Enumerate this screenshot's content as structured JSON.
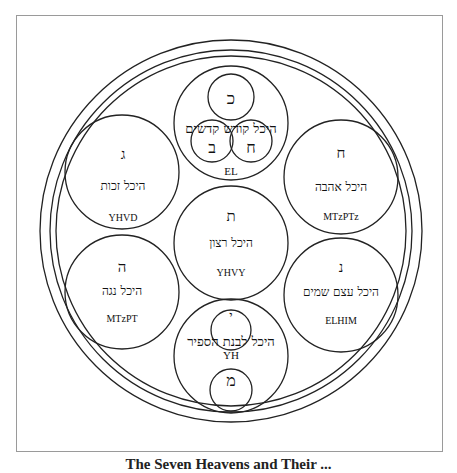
{
  "diagram": {
    "caption": "The Seven Heavens and Their ...",
    "circles": [
      {
        "id": "top",
        "letter": "כ",
        "title": "היכל קודש קדשים",
        "name": "EL",
        "sub": [
          {
            "letter": "כ"
          },
          {
            "letter": "ב"
          },
          {
            "letter": "ח"
          }
        ]
      },
      {
        "id": "upper-left",
        "letter": "ג",
        "title": "היכל זכות",
        "name": "YHVD"
      },
      {
        "id": "upper-right",
        "letter": "ח",
        "title": "היכל אהבה",
        "name": "MTzPTz"
      },
      {
        "id": "center",
        "letter": "ת",
        "title": "היכל רצון",
        "name": "YHVY"
      },
      {
        "id": "lower-left",
        "letter": "ה",
        "title": "היכל נגה",
        "name": "MTzPT"
      },
      {
        "id": "lower-right",
        "letter": "נ",
        "title": "היכל עצם שמים",
        "name": "ELHIM"
      },
      {
        "id": "bottom",
        "letter": "י",
        "title": "היכל לבנת הספיר",
        "name": "YH",
        "sub": [
          {
            "letter": "י"
          },
          {
            "letter": "מ"
          }
        ]
      }
    ]
  }
}
